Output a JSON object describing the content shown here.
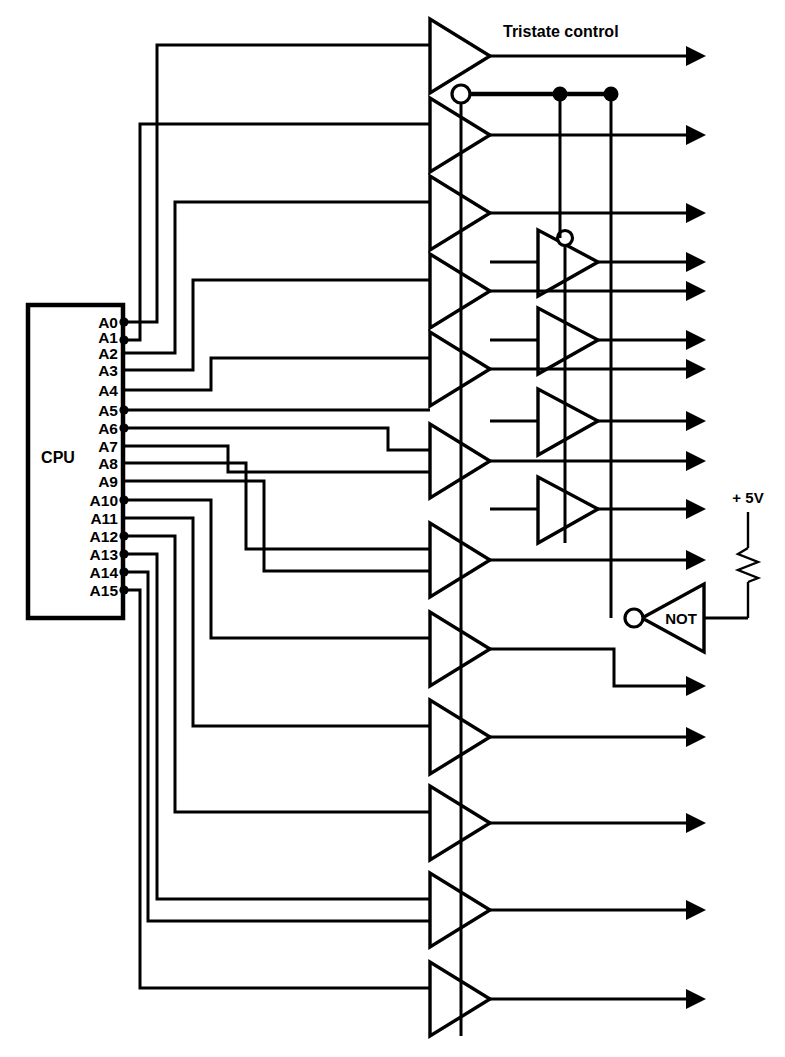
{
  "diagram": {
    "type": "schematic",
    "background_color": "#ffffff",
    "line_color": "#000000"
  },
  "cpu": {
    "label": "CPU",
    "box": {
      "x": 28,
      "y": 305,
      "width": 95,
      "height": 313
    },
    "pins": [
      {
        "label": "A0",
        "y": 322
      },
      {
        "label": "A1",
        "y": 337
      },
      {
        "label": "A2",
        "y": 353
      },
      {
        "label": "A3",
        "y": 370
      },
      {
        "label": "A4",
        "y": 390
      },
      {
        "label": "A5",
        "y": 410
      },
      {
        "label": "A6",
        "y": 428
      },
      {
        "label": "A7",
        "y": 446
      },
      {
        "label": "A8",
        "y": 463
      },
      {
        "label": "A9",
        "y": 481
      },
      {
        "label": "A10",
        "y": 500
      },
      {
        "label": "A11",
        "y": 518
      },
      {
        "label": "A12",
        "y": 536
      },
      {
        "label": "A13",
        "y": 554
      },
      {
        "label": "A14",
        "y": 572
      },
      {
        "label": "A15",
        "y": 590
      }
    ]
  },
  "labels": {
    "tristate_control": "Tristate control",
    "not_gate": "NOT",
    "supply": "+ 5V"
  },
  "buffers_main": [
    {
      "name": "buffer-tristate-control",
      "y": 56
    },
    {
      "name": "buffer-a0",
      "y": 135
    },
    {
      "name": "buffer-a1",
      "y": 213
    },
    {
      "name": "buffer-a2",
      "y": 291
    },
    {
      "name": "buffer-a3",
      "y": 369
    },
    {
      "name": "buffer-a4",
      "y": 461
    },
    {
      "name": "buffer-a5",
      "y": 560
    },
    {
      "name": "buffer-a6",
      "y": 649
    },
    {
      "name": "buffer-a7",
      "y": 737
    },
    {
      "name": "buffer-a8",
      "y": 823
    },
    {
      "name": "buffer-a9",
      "y": 910
    },
    {
      "name": "buffer-a10",
      "y": 999
    }
  ],
  "buffers_second_column": [
    {
      "name": "buffer-b0",
      "y": 262,
      "has_enable_bubble": true
    },
    {
      "name": "buffer-b1",
      "y": 340,
      "has_enable_bubble": false
    },
    {
      "name": "buffer-b2",
      "y": 421,
      "has_enable_bubble": false
    },
    {
      "name": "buffer-b3",
      "y": 509,
      "has_enable_bubble": false
    }
  ],
  "outputs": [
    {
      "name": "output-tristate-control",
      "y": 56
    },
    {
      "name": "output-a0",
      "y": 135
    },
    {
      "name": "output-a1",
      "y": 213
    },
    {
      "name": "output-a2",
      "y": 262
    },
    {
      "name": "output-a3",
      "y": 291
    },
    {
      "name": "output-a4",
      "y": 340
    },
    {
      "name": "output-a5",
      "y": 369
    },
    {
      "name": "output-a6",
      "y": 421
    },
    {
      "name": "output-a7",
      "y": 461
    },
    {
      "name": "output-a8",
      "y": 509
    },
    {
      "name": "output-a9",
      "y": 560
    },
    {
      "name": "output-a10",
      "y": 686
    },
    {
      "name": "output-a11",
      "y": 737
    },
    {
      "name": "output-a12",
      "y": 823
    },
    {
      "name": "output-a13",
      "y": 910
    },
    {
      "name": "output-a14",
      "y": 999
    }
  ],
  "control_bus": {
    "y": 94,
    "bubble_x": 461,
    "junctions": [
      560,
      611
    ],
    "vertical_drops": [
      {
        "x": 560,
        "to_y": 238
      },
      {
        "x": 611,
        "to_y": 610
      }
    ]
  },
  "not_gate": {
    "label": "NOT",
    "x": 648,
    "y": 618,
    "bubble_x": 634,
    "direction": "left"
  },
  "pullup": {
    "label": "+ 5V",
    "x": 748,
    "top_y": 512,
    "resistor_top": 548,
    "resistor_bottom": 582,
    "bottom_y": 618
  }
}
